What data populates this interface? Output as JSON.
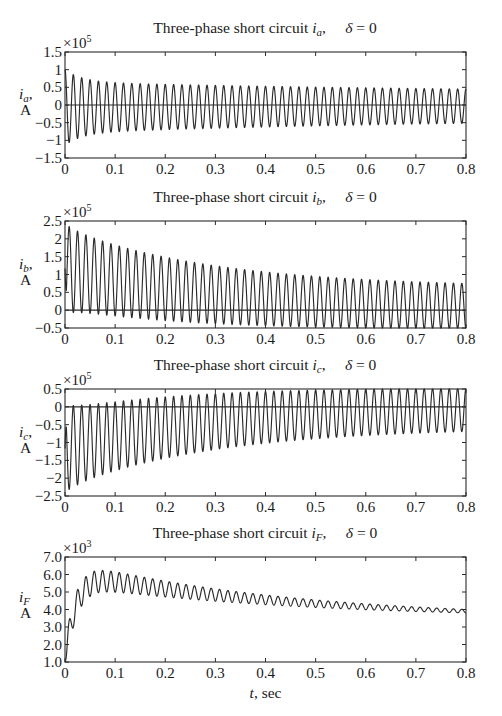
{
  "chart_data": [
    {
      "type": "line",
      "title": "Three-phase short circuit i_a,    δ = 0",
      "title_parts": {
        "prefix": "Three-phase short circuit ",
        "var": "i",
        "sub": "a",
        "suffix": ",",
        "delta": "δ = 0"
      },
      "ylabel": "i_a, A",
      "ylabel_parts": {
        "var": "i",
        "sub": "a",
        "unit": "A"
      },
      "xlabel": "",
      "exponent": "×10^5",
      "exponent_parts": {
        "base": "×10",
        "power": "5"
      },
      "xlim": [
        0,
        0.8
      ],
      "ylim": [
        -1.5,
        1.5
      ],
      "xticks": [
        "0",
        "0.1",
        "0.2",
        "0.3",
        "0.4",
        "0.5",
        "0.6",
        "0.7",
        "0.8"
      ],
      "yticks": [
        "1.5",
        "1",
        "0.5",
        "0",
        "−0.5",
        "−1",
        "−1.5"
      ],
      "ytick_values": [
        1.5,
        1,
        0.5,
        0,
        -0.5,
        -1,
        -1.5
      ],
      "zero_line": 0,
      "series": [
        {
          "name": "i_a",
          "frequency_hz": 60,
          "description": "Symmetrical AC decaying from ~1.15 to ~0.45 amplitude (×10^5 A), small negative DC offset",
          "ac_amplitude_initial": 1.2,
          "ac_amplitude_subtransient_extra": 0.35,
          "tau_subtransient": 0.035,
          "ac_amplitude_transient_extra": 0.4,
          "tau_transient": 0.9,
          "ac_amplitude_steady": 0.32,
          "dc_offset_initial": 0.0,
          "tau_dc": 0.05,
          "phase": 0.0,
          "sign": 1
        }
      ],
      "key_points": [
        {
          "t": 0.004,
          "value": 1.22
        },
        {
          "t": 0.012,
          "value": -1.05
        },
        {
          "t": 0.1,
          "value": 0.85
        },
        {
          "t": 0.4,
          "value": 0.6
        },
        {
          "t": 0.8,
          "value": 0.45
        }
      ]
    },
    {
      "type": "line",
      "title": "Three-phase short circuit i_b,    δ = 0",
      "title_parts": {
        "prefix": "Three-phase short circuit ",
        "var": "i",
        "sub": "b",
        "suffix": ",",
        "delta": "δ = 0"
      },
      "ylabel": "i_b, A",
      "ylabel_parts": {
        "var": "i",
        "sub": "b",
        "unit": "A"
      },
      "xlabel": "",
      "exponent": "×10^5",
      "exponent_parts": {
        "base": "×10",
        "power": "5"
      },
      "xlim": [
        0,
        0.8
      ],
      "ylim": [
        -0.5,
        2.5
      ],
      "xticks": [
        "0",
        "0.1",
        "0.2",
        "0.3",
        "0.4",
        "0.5",
        "0.6",
        "0.7",
        "0.8"
      ],
      "yticks": [
        "2.5",
        "2",
        "1.5",
        "1",
        "0.5",
        "0",
        "−0.5"
      ],
      "ytick_values": [
        2.5,
        2,
        1.5,
        1,
        0.5,
        0,
        -0.5
      ],
      "zero_line": 0,
      "series": [
        {
          "name": "i_b",
          "frequency_hz": 60,
          "description": "Fully offset AC: peaks decaying from ~2.25 to ~0.65, troughs near 0 drifting to ~-0.3 (×10^5 A)",
          "ac_amplitude_initial": 1.12,
          "dc_offset_initial": 1.12,
          "tau_dc": 0.28,
          "phase": 3.14159,
          "sign": 1
        }
      ],
      "key_points": [
        {
          "t": 0.008,
          "value": 2.25
        },
        {
          "t": 0.1,
          "value": 1.7
        },
        {
          "t": 0.4,
          "value": 1.2
        },
        {
          "t": 0.8,
          "value": 0.7
        },
        {
          "t": 0.8,
          "value": -0.3
        }
      ]
    },
    {
      "type": "line",
      "title": "Three-phase short circuit i_c,    δ = 0",
      "title_parts": {
        "prefix": "Three-phase short circuit ",
        "var": "i",
        "sub": "c",
        "suffix": ",",
        "delta": "δ = 0"
      },
      "ylabel": "i_c, A",
      "ylabel_parts": {
        "var": "i",
        "sub": "c",
        "unit": "A"
      },
      "xlabel": "",
      "exponent": "×10^5",
      "exponent_parts": {
        "base": "×10",
        "power": "5"
      },
      "xlim": [
        0,
        0.8
      ],
      "ylim": [
        -2.5,
        0.5
      ],
      "xticks": [
        "0",
        "0.1",
        "0.2",
        "0.3",
        "0.4",
        "0.5",
        "0.6",
        "0.7",
        "0.8"
      ],
      "yticks": [
        "0.5",
        "0",
        "−0.5",
        "−1",
        "−1.5",
        "−2",
        "−2.5"
      ],
      "ytick_values": [
        0.5,
        0,
        -0.5,
        -1,
        -1.5,
        -2,
        -2.5
      ],
      "zero_line": 0,
      "series": [
        {
          "name": "i_c",
          "frequency_hz": 60,
          "description": "Negatively offset AC: troughs from ~-2.3 rising to ~-0.5, peaks near 0 rising to ~0.4 (×10^5 A)",
          "ac_amplitude_initial": 1.15,
          "dc_offset_initial": -1.15,
          "tau_dc": 0.28,
          "phase": 0.0,
          "sign": 1
        }
      ],
      "key_points": [
        {
          "t": 0.008,
          "value": -2.3
        },
        {
          "t": 0.1,
          "value": -1.7
        },
        {
          "t": 0.4,
          "value": -1.0
        },
        {
          "t": 0.8,
          "value": -0.5
        },
        {
          "t": 0.8,
          "value": 0.4
        }
      ]
    },
    {
      "type": "line",
      "title": "Three-phase short circuit i_F,    δ = 0",
      "title_parts": {
        "prefix": "Three-phase short circuit ",
        "var": "i",
        "sub": "F",
        "suffix": ",",
        "delta": "δ = 0"
      },
      "ylabel": "i_F A",
      "ylabel_parts": {
        "var": "i",
        "sub": "F",
        "unit": "A"
      },
      "xlabel": "t, sec",
      "exponent": "×10^3",
      "exponent_parts": {
        "base": "×10",
        "power": "3"
      },
      "xlim": [
        0,
        0.8
      ],
      "ylim": [
        1.0,
        7.0
      ],
      "xticks": [
        "0",
        "0.1",
        "0.2",
        "0.3",
        "0.4",
        "0.5",
        "0.6",
        "0.7",
        "0.8"
      ],
      "yticks": [
        "7.0",
        "6.0",
        "5.0",
        "4.0",
        "3.0",
        "2.0",
        "1.0"
      ],
      "ytick_values": [
        7,
        6,
        5,
        4,
        3,
        2,
        1
      ],
      "zero_line": null,
      "series": [
        {
          "name": "i_F",
          "frequency_hz": 60,
          "description": "Field current rising from ~1.0 to mean ~5.5 around t=0.08, then decaying to ~3.5 at t=0.8 with 60 Hz ripple shrinking from ~±0.7 to ~±0.15 (×10^3 A)",
          "start_value": 1.0,
          "peak_mean": 5.5,
          "rise_tau": 0.02,
          "end_mean": 3.45,
          "ripple_initial": 0.75,
          "ripple_tau": 0.4
        }
      ],
      "key_points": [
        {
          "t": 0.0,
          "value": 1.0
        },
        {
          "t": 0.01,
          "value": 4.1
        },
        {
          "t": 0.018,
          "value": 3.1
        },
        {
          "t": 0.025,
          "value": 5.4
        },
        {
          "t": 0.08,
          "value": 6.2
        },
        {
          "t": 0.4,
          "value": 4.9
        },
        {
          "t": 0.8,
          "value": 3.4
        }
      ]
    }
  ],
  "layout": {
    "plot_left": 65,
    "plot_right": 466,
    "plots": [
      {
        "top": 52,
        "bottom": 158,
        "title_y": 33
      },
      {
        "top": 221,
        "bottom": 328,
        "title_y": 202
      },
      {
        "top": 389,
        "bottom": 496,
        "title_y": 370
      },
      {
        "top": 557,
        "bottom": 662,
        "title_y": 538
      }
    ],
    "xlabel_y": 698,
    "line_color": "#2a2a2a"
  }
}
